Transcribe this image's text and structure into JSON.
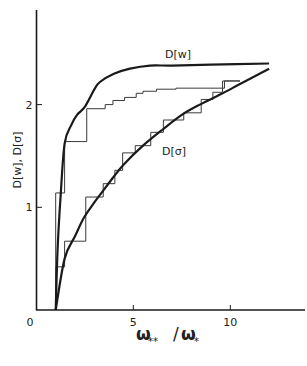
{
  "chart_data": {
    "type": "line",
    "title": "",
    "xlabel": "ω**/ω*",
    "ylabel": "D[w], D[σ]",
    "xlim": [
      0,
      14
    ],
    "ylim": [
      0,
      2.9
    ],
    "xticks": [
      0,
      5,
      10
    ],
    "xtick_labels": [
      "0",
      "5",
      "10"
    ],
    "yticks": [
      1,
      2
    ],
    "ytick_labels": [
      "1",
      "2"
    ],
    "grid": false,
    "legend": "none (inline curve labels)",
    "annotations": [
      {
        "text": "D[w]",
        "x": 7.0,
        "y": 2.5
      },
      {
        "text": "D[σ]",
        "x": 7.0,
        "y": 1.55
      }
    ],
    "series": [
      {
        "name": "D[w]",
        "style": "smooth",
        "x": [
          1.0,
          1.1,
          1.25,
          1.46,
          1.8,
          2.1,
          2.51,
          3.0,
          3.28,
          4.0,
          4.83,
          5.86,
          7.0,
          9.0,
          12.0
        ],
        "y": [
          0.0,
          0.6,
          1.1,
          1.62,
          1.8,
          1.9,
          1.98,
          2.15,
          2.22,
          2.3,
          2.35,
          2.38,
          2.38,
          2.39,
          2.4
        ]
      },
      {
        "name": "D[σ]",
        "style": "smooth",
        "x": [
          1.0,
          1.46,
          2.0,
          2.46,
          3.0,
          3.44,
          4.0,
          4.52,
          5.5,
          6.53,
          7.5,
          8.43,
          9.5,
          10.5,
          12.0
        ],
        "y": [
          0.0,
          0.5,
          0.72,
          0.9,
          1.05,
          1.16,
          1.3,
          1.42,
          1.6,
          1.76,
          1.9,
          2.0,
          2.1,
          2.2,
          2.35
        ]
      },
      {
        "name": "D[w] staircase",
        "style": "step",
        "x": [
          1.0,
          1.0,
          1.0,
          1.46,
          1.46,
          2.6,
          2.6,
          3.55,
          3.55,
          3.95,
          3.95,
          4.55,
          4.55,
          5.15,
          5.15,
          5.5,
          5.5,
          6.2,
          6.2,
          7.2,
          7.2,
          9.7,
          9.7,
          10.5
        ],
        "y": [
          0.0,
          0.42,
          1.14,
          1.14,
          1.64,
          1.64,
          1.96,
          1.96,
          2.0,
          2.0,
          2.04,
          2.04,
          2.07,
          2.07,
          2.11,
          2.11,
          2.13,
          2.13,
          2.15,
          2.15,
          2.16,
          2.16,
          2.23,
          2.23
        ]
      },
      {
        "name": "D[σ] staircase",
        "step_style": "step",
        "x": [
          1.0,
          1.0,
          1.46,
          1.46,
          2.55,
          2.55,
          3.45,
          3.45,
          4.05,
          4.05,
          4.45,
          4.45,
          5.1,
          5.1,
          5.9,
          5.9,
          6.55,
          6.55,
          7.6,
          7.6,
          8.5,
          8.5,
          9.1,
          9.1,
          9.6,
          9.6,
          10.5
        ],
        "y": [
          0.0,
          0.42,
          0.42,
          0.67,
          0.67,
          1.1,
          1.1,
          1.23,
          1.23,
          1.36,
          1.36,
          1.53,
          1.53,
          1.6,
          1.6,
          1.73,
          1.73,
          1.85,
          1.85,
          1.92,
          1.92,
          2.05,
          2.05,
          2.12,
          2.12,
          2.23,
          2.23
        ]
      }
    ]
  },
  "axes": {
    "x_title_main": "ω",
    "x_title_sub1": "**",
    "x_title_sep": "/",
    "x_title_main2": "ω",
    "x_title_sub2": "*",
    "y_title": "D[w], D[σ]"
  },
  "colors": {
    "ink": "#1a1a1a",
    "step_ink": "#3a3a3a",
    "background": "#ffffff"
  }
}
